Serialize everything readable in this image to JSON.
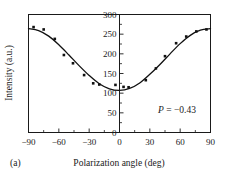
{
  "figure": {
    "panel_label": "(a)",
    "annotation": {
      "symbol": "P",
      "equals": " = ",
      "value": "−0.43"
    }
  },
  "chart_data": {
    "type": "scatter",
    "title": "",
    "xlabel": "Polarization angle (deg)",
    "ylabel": "Intensity (a.u.)",
    "xlim": [
      -90,
      90
    ],
    "ylim": [
      0,
      300
    ],
    "xticks": [
      -90,
      -60,
      -30,
      0,
      30,
      60,
      90
    ],
    "xticklabels": [
      "−90",
      "−60",
      "−30",
      "0",
      "30",
      "60",
      "90"
    ],
    "yticks": [
      0,
      50,
      100,
      150,
      200,
      250,
      300
    ],
    "yticklabels": [
      "0",
      "50",
      "100",
      "150",
      "200",
      "250",
      "300"
    ],
    "x_minor_interval": 15,
    "y_minor_interval": 25,
    "grid": false,
    "legend": null,
    "annotations": [
      {
        "text": "P = −0.43",
        "x": 55,
        "y": 45
      }
    ],
    "series": [
      {
        "name": "measured intensity",
        "type": "scatter",
        "marker": "square",
        "color": "#111111",
        "points": [
          {
            "x": -85,
            "y": 268
          },
          {
            "x": -75,
            "y": 262
          },
          {
            "x": -64,
            "y": 238
          },
          {
            "x": -55,
            "y": 197
          },
          {
            "x": -46,
            "y": 176
          },
          {
            "x": -35,
            "y": 146
          },
          {
            "x": -26,
            "y": 125
          },
          {
            "x": -20,
            "y": 122
          },
          {
            "x": -4,
            "y": 121
          },
          {
            "x": 4,
            "y": 116
          },
          {
            "x": 9,
            "y": 115
          },
          {
            "x": 26,
            "y": 133
          },
          {
            "x": 36,
            "y": 163
          },
          {
            "x": 45,
            "y": 194
          },
          {
            "x": 56,
            "y": 227
          },
          {
            "x": 66,
            "y": 244
          },
          {
            "x": 76,
            "y": 257
          },
          {
            "x": 86,
            "y": 262
          }
        ]
      },
      {
        "name": "cosine fit",
        "type": "line",
        "color": "#111111",
        "model": "I = I0 + A*cos(2*(theta - theta0))",
        "fit_params": {
          "I0": 186,
          "A": 79,
          "theta0_deg": -88
        },
        "points": [
          {
            "x": -90,
            "y": 264
          },
          {
            "x": -80,
            "y": 259
          },
          {
            "x": -70,
            "y": 245
          },
          {
            "x": -60,
            "y": 223
          },
          {
            "x": -50,
            "y": 197
          },
          {
            "x": -40,
            "y": 170
          },
          {
            "x": -30,
            "y": 145
          },
          {
            "x": -20,
            "y": 124
          },
          {
            "x": -10,
            "y": 111
          },
          {
            "x": 0,
            "y": 107
          },
          {
            "x": 10,
            "y": 112
          },
          {
            "x": 20,
            "y": 126
          },
          {
            "x": 30,
            "y": 148
          },
          {
            "x": 40,
            "y": 173
          },
          {
            "x": 50,
            "y": 200
          },
          {
            "x": 60,
            "y": 226
          },
          {
            "x": 70,
            "y": 247
          },
          {
            "x": 80,
            "y": 260
          },
          {
            "x": 90,
            "y": 264
          }
        ]
      }
    ]
  }
}
